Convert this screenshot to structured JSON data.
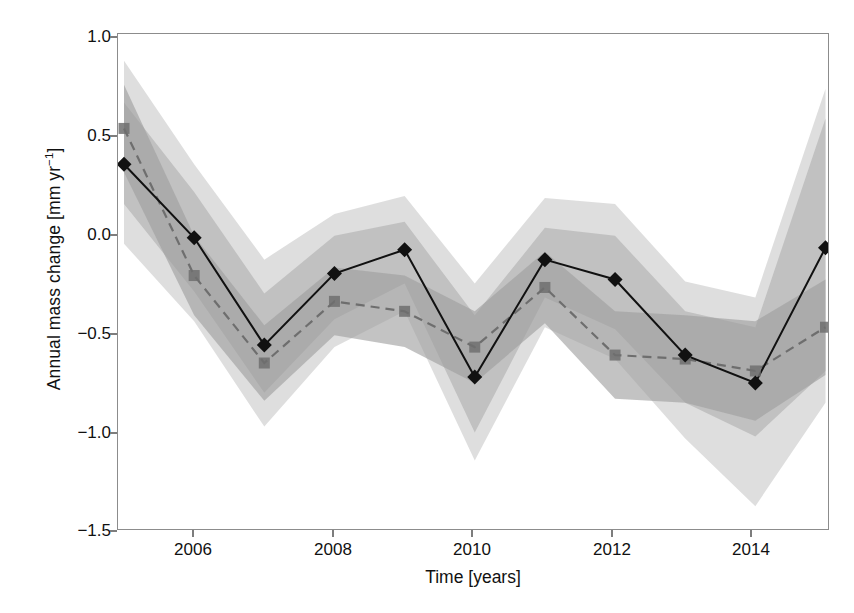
{
  "chart_data": {
    "type": "line",
    "title": "",
    "xlabel": "Time [years]",
    "ylabel": "Annual mass change [mm yr⁻¹]",
    "xlim": [
      2004.9,
      2015.05
    ],
    "ylim": [
      -1.5,
      1.0
    ],
    "xticks": [
      2006,
      2008,
      2010,
      2012,
      2014
    ],
    "xtick_labels": [
      "2006",
      "2008",
      "2010",
      "2012",
      "2014"
    ],
    "yticks": [
      1.0,
      0.5,
      0.0,
      -0.5,
      -1.0,
      -1.5
    ],
    "ytick_labels": [
      "1.0",
      "0.5",
      "0.0",
      "−0.5",
      "−1.0",
      "−1.5"
    ],
    "grid": false,
    "legend": "none",
    "x": [
      2005,
      2006,
      2007,
      2008,
      2009,
      2010,
      2011,
      2012,
      2013,
      2014,
      2015
    ],
    "series": [
      {
        "name": "solid-diamond-series",
        "marker": "diamond",
        "linestyle": "solid",
        "color": "#111111",
        "values": [
          0.34,
          -0.03,
          -0.57,
          -0.21,
          -0.09,
          -0.73,
          -0.14,
          -0.24,
          -0.62,
          -0.76,
          -0.08
        ],
        "band_inner_upper": [
          0.65,
          0.2,
          -0.31,
          -0.02,
          0.05,
          -0.42,
          0.02,
          -0.02,
          -0.4,
          -0.48,
          0.57
        ],
        "band_inner_lower": [
          0.14,
          -0.3,
          -0.81,
          -0.44,
          -0.26,
          -1.01,
          -0.33,
          -0.49,
          -0.86,
          -1.03,
          -0.7
        ],
        "band_outer_upper": [
          0.86,
          0.34,
          -0.14,
          0.09,
          0.18,
          -0.26,
          0.17,
          0.14,
          -0.25,
          -0.33,
          0.72
        ],
        "band_outer_lower": [
          -0.06,
          -0.45,
          -0.98,
          -0.58,
          -0.4,
          -1.15,
          -0.48,
          -0.64,
          -1.04,
          -1.38,
          -0.86
        ]
      },
      {
        "name": "dashed-square-series",
        "marker": "square",
        "linestyle": "dashed",
        "color": "#6e6e6e",
        "values": [
          0.52,
          -0.22,
          -0.66,
          -0.35,
          -0.4,
          -0.58,
          -0.28,
          -0.62,
          -0.64,
          -0.7,
          -0.48
        ],
        "band_inner_upper": [
          0.74,
          -0.02,
          -0.47,
          -0.18,
          -0.22,
          -0.4,
          -0.1,
          -0.4,
          -0.42,
          -0.45,
          -0.24
        ],
        "band_inner_lower": [
          0.3,
          -0.42,
          -0.85,
          -0.52,
          -0.58,
          -0.76,
          -0.46,
          -0.84,
          -0.86,
          -0.95,
          -0.72
        ]
      }
    ]
  },
  "axes": {
    "ylabel_text": "Annual mass change [mm yr",
    "ylabel_sup": "−1",
    "ylabel_tail": "]",
    "xlabel_text": "Time [years]"
  },
  "colors": {
    "frame": "#8c8c8c",
    "band_outer": "#dcdcdc",
    "band_inner": "#b9b9b9",
    "band_dashed": "#9e9e9e",
    "solid_line": "#111111",
    "dashed_line": "#6e6e6e",
    "background": "#ffffff"
  }
}
